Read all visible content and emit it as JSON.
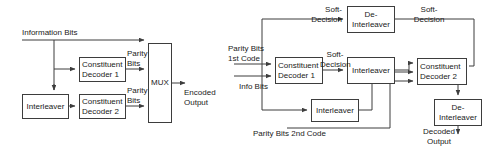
{
  "figure": {
    "stroke_color": "#3d3d3d",
    "text_color": "#1a1a1a",
    "background": "#ffffff"
  },
  "encoder": {
    "name": "Turbo encoder block diagram",
    "boxes": [
      {
        "id": "interleaver",
        "lines": [
          "Interleaver"
        ],
        "x": 22,
        "y": 94,
        "w": 47,
        "h": 25,
        "align": "center"
      },
      {
        "id": "constituent_decoder_1",
        "lines": [
          "Constituent",
          "Decoder 1"
        ],
        "x": 79,
        "y": 57,
        "w": 47,
        "h": 25,
        "align": "left"
      },
      {
        "id": "constituent_decoder_2",
        "lines": [
          "Constituent",
          "Decoder 2"
        ],
        "x": 79,
        "y": 94,
        "w": 47,
        "h": 25,
        "align": "left"
      },
      {
        "id": "mux",
        "lines": [
          "MUX"
        ],
        "x": 148,
        "y": 43,
        "w": 24,
        "h": 80,
        "align": "center"
      }
    ],
    "labels": [
      {
        "id": "information_bits",
        "lines": [
          "Information Bits"
        ],
        "x": 22,
        "y": 28,
        "align": "left"
      },
      {
        "id": "parity_bits_1",
        "lines": [
          "Parity",
          "Bits"
        ],
        "x": 126,
        "y": 50,
        "align": "left"
      },
      {
        "id": "parity_bits_2",
        "lines": [
          "Parity",
          "Bits"
        ],
        "x": 126,
        "y": 87,
        "align": "left"
      },
      {
        "id": "encoded_output",
        "lines": [
          "Encoded",
          "Output"
        ],
        "x": 183,
        "y": 83,
        "align": "left"
      }
    ]
  },
  "decoder": {
    "name": "Turbo decoder block diagram",
    "boxes": [
      {
        "id": "de_interleaver_top",
        "lines": [
          "De-",
          "Interleaver"
        ],
        "x": 347,
        "y": 6,
        "w": 48,
        "h": 27,
        "align": "center"
      },
      {
        "id": "constituent_decoder_1",
        "lines": [
          "Constituent",
          "Decoder 1"
        ],
        "x": 275,
        "y": 57,
        "w": 48,
        "h": 27,
        "align": "left"
      },
      {
        "id": "interleaver_mid",
        "lines": [
          "Interleaver"
        ],
        "x": 347,
        "y": 57,
        "w": 48,
        "h": 27,
        "align": "center"
      },
      {
        "id": "constituent_decoder_2",
        "lines": [
          "Constituent",
          "Decoder 2"
        ],
        "x": 417,
        "y": 58,
        "w": 48,
        "h": 27,
        "align": "left"
      },
      {
        "id": "interleaver_bottom",
        "lines": [
          "Interleaver"
        ],
        "x": 311,
        "y": 99,
        "w": 48,
        "h": 23,
        "align": "center"
      },
      {
        "id": "de_interleaver_bottom",
        "lines": [
          "De-",
          "Interleaver"
        ],
        "x": 434,
        "y": 99,
        "w": 48,
        "h": 27,
        "align": "center"
      }
    ],
    "labels": [
      {
        "id": "soft_decision_top_left",
        "lines": [
          "Soft-",
          "Decision"
        ],
        "x": 300,
        "y": 6,
        "align": "right"
      },
      {
        "id": "soft_decision_top_right",
        "lines": [
          "Soft-",
          "Decision"
        ],
        "x": 403,
        "y": 6,
        "align": "left"
      },
      {
        "id": "parity_bits_1st_code",
        "lines": [
          "Parity Bits",
          "1st Code"
        ],
        "x": 228,
        "y": 45,
        "align": "left"
      },
      {
        "id": "soft_decision_mid",
        "lines": [
          "Soft-",
          "Decision"
        ],
        "x": 310,
        "y": 51,
        "align": "left"
      },
      {
        "id": "info_bits",
        "lines": [
          "Info Bits"
        ],
        "x": 240,
        "y": 83,
        "align": "left"
      },
      {
        "id": "parity_bits_2nd_code",
        "lines": [
          "Parity Bits 2nd Code"
        ],
        "x": 252,
        "y": 130,
        "align": "left"
      },
      {
        "id": "decoded_output",
        "lines": [
          "Decoded",
          "Output"
        ],
        "x": 421,
        "y": 128,
        "align": "left"
      }
    ]
  },
  "wires": {
    "encoder_paths": [
      "M22,40 L148,40",
      "M54,40 L54,63 L75,63",
      "M54,40 L54,90",
      "M69,106 L75,106",
      "M126,69 L145,69",
      "M126,106 L145,106",
      "M172,83 L190,83"
    ],
    "decoder_paths": [
      "M262,40 L262,19 L343,19",
      "M395,19 L471,19 L471,68",
      "M232,64 L271,64",
      "M232,76 L271,76",
      "M323,70 L343,70",
      "M395,70 L413,70",
      "M262,40 L262,110 L307,110",
      "M359,110 L372,110 L372,78",
      "M372,78 L413,78",
      "M287,140 L287,110",
      "M441,85 L441,95",
      "M434,112 L421,112"
    ]
  }
}
